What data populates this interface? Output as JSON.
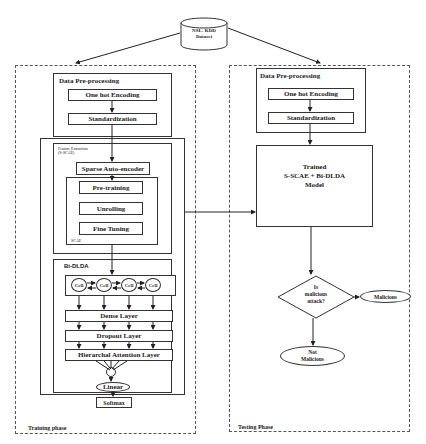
{
  "dataset": {
    "label_line1": "NSL- KDD",
    "label_line2": "Dataset"
  },
  "training": {
    "phase_label": "Training phase",
    "preprocessing": {
      "title": "Data Pre-processing",
      "steps": [
        "One hot Encoding",
        "Standardization"
      ]
    },
    "feature_extraction": {
      "title_line1": "Feature Extraction",
      "title_line2": "(S-SCAE)",
      "sparse_autoencoder": "Sparse Auto-encoder",
      "scae": {
        "label": "SCAE",
        "steps": [
          "Pre-training",
          "Unrolling",
          "Fine Tuning"
        ]
      }
    },
    "bi_dlda": {
      "title": "Bi-DLDA",
      "cells": [
        "Cell",
        "Cell",
        "Cell",
        "Cell"
      ],
      "layers": [
        "Dense Layer",
        "Dropout Layer",
        "Hierarchal Attention Layer"
      ],
      "linear": "Linear",
      "softmax": "Softmax"
    }
  },
  "testing": {
    "phase_label": "Testing Phase",
    "preprocessing": {
      "title": "Data Pre-processing",
      "steps": [
        "One hot Encoding",
        "Standardization"
      ]
    },
    "model": {
      "line1": "Trained",
      "line2": "S-SCAE + Bi-DLDA",
      "line3": "Model"
    },
    "decision": {
      "line1": "Is",
      "line2": "malicious",
      "line3": "attack?"
    },
    "outcomes": {
      "malicious": "Malicious",
      "not_malicious_line1": "Not",
      "not_malicious_line2": "Malicious"
    }
  },
  "colors": {
    "line": "#333333",
    "dashed": "#555555",
    "background": "#ffffff"
  }
}
